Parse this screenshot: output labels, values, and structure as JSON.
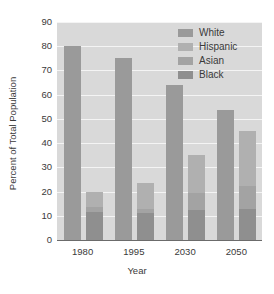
{
  "chart_data": {
    "type": "bar",
    "title": "",
    "xlabel": "Year",
    "ylabel": "Percent of Total Population",
    "categories": [
      "1980",
      "1995",
      "2030",
      "2050"
    ],
    "ylim": [
      0,
      90
    ],
    "yticks": [
      0,
      10,
      20,
      30,
      40,
      50,
      60,
      70,
      80,
      90
    ],
    "ytick_labels": [
      "0",
      "10",
      "20",
      "30",
      "40",
      "50",
      "60",
      "70",
      "80",
      "90"
    ],
    "grid": true,
    "legend_position": "top-right",
    "bar_layout": "white-bar-plus-stacked-minority-bar",
    "series": [
      {
        "name": "White",
        "stack": "white",
        "values": [
          80,
          75,
          64,
          53.5
        ],
        "color": "#9a9a9a"
      },
      {
        "name": "Hispanic",
        "stack": "minority",
        "values": [
          6.5,
          10.5,
          15.5,
          22.5
        ],
        "color": "#b0b0b0"
      },
      {
        "name": "Asian",
        "stack": "minority",
        "values": [
          2,
          2,
          7,
          9.5
        ],
        "color": "#a3a3a3"
      },
      {
        "name": "Black",
        "stack": "minority",
        "values": [
          11.5,
          11,
          12.5,
          13
        ],
        "color": "#8f8f8f"
      }
    ],
    "minority_totals": [
      20,
      23.5,
      35,
      45
    ]
  },
  "legend": {
    "items": [
      {
        "label": "White",
        "color": "#9a9a9a"
      },
      {
        "label": "Hispanic",
        "color": "#b0b0b0"
      },
      {
        "label": "Asian",
        "color": "#a3a3a3"
      },
      {
        "label": "Black",
        "color": "#8f8f8f"
      }
    ]
  },
  "colors": {
    "plot_background": "#d9d9d9",
    "gridline": "#f4f4f4",
    "axis": "#6b6b6b",
    "text": "#3a3a3a",
    "page_background": "#ffffff"
  }
}
